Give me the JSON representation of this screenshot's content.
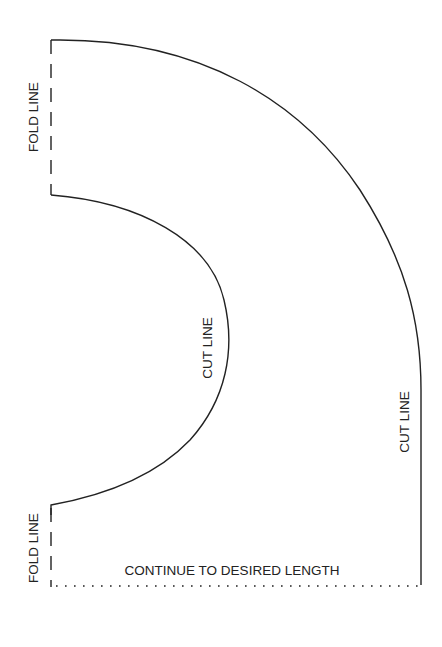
{
  "labels": {
    "fold_top": "FOLD LINE",
    "fold_bottom": "FOLD LINE",
    "cut_inner": "CUT LINE",
    "cut_outer": "CUT LINE",
    "continue": "CONTINUE TO DESIRED LENGTH"
  },
  "colors": {
    "line": "#222222",
    "background": "#ffffff"
  }
}
